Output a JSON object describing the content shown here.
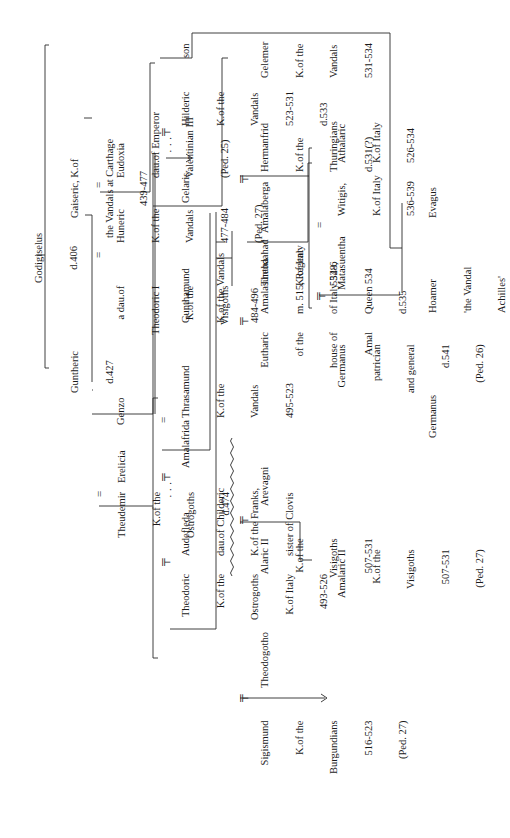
{
  "chart_title": "Genealogy of the Vandal and Ostrogothic royal houses",
  "orientation": "rotated 90 degrees counter-clockwise",
  "nodes": {
    "godigiselus": {
      "lines": [
        "Godigiselus",
        "d.406"
      ]
    },
    "guntheric": {
      "lines": [
        "Guntheric",
        "d.427"
      ]
    },
    "gaiseric": {
      "lines": [
        "Gaiseric, K.of",
        "the Vandals at Carthage",
        "439-477"
      ]
    },
    "genzo": {
      "lines": [
        "Genzo"
      ]
    },
    "dau_theodoric_i": {
      "lines": [
        "a dau.of",
        "Theodoric I",
        "K.of the",
        "Visigoths"
      ]
    },
    "huneric": {
      "lines": [
        "Huneric",
        "K.of the",
        "Vandals",
        "477-484",
        "(Ped. 27)"
      ]
    },
    "eudoxia": {
      "lines": [
        "Eudoxia",
        "dau.of Emperor",
        "Valentinian III",
        "(Ped. 25)"
      ]
    },
    "thrasamund": {
      "lines": [
        "Thrasamund",
        "K.of the",
        "Vandals",
        "495-523"
      ]
    },
    "gunthamund": {
      "lines": [
        "Gunthamund",
        "K.of the Vandals",
        "484-496"
      ]
    },
    "gelaris": {
      "lines": [
        "Gelaris"
      ]
    },
    "hilderic_dots": {
      "lines": [
        "· · ·"
      ]
    },
    "hilderic": {
      "lines": [
        "Hilderic",
        "K.of the",
        "Vandals",
        "523-531",
        "d.533"
      ]
    },
    "son": {
      "lines": [
        "son"
      ]
    },
    "gelemer": {
      "lines": [
        "Gelemer",
        "K.of the",
        "Vandals",
        "531-534"
      ]
    },
    "hoamer": {
      "lines": [
        "Hoamer",
        "'the Vandal",
        "Achilles'"
      ]
    },
    "evagus": {
      "lines": [
        "Evagus"
      ]
    },
    "theudemir": {
      "lines": [
        "Theudemir",
        "K.of the",
        "Ostrogoths",
        "d.474"
      ]
    },
    "erelicia": {
      "lines": [
        "Erelicia"
      ]
    },
    "theodoric": {
      "lines": [
        "Theodoric",
        "K.of the",
        "Ostrogoths",
        "K.of Italy",
        "493-526"
      ]
    },
    "audefleda": {
      "lines": [
        "Audefleda",
        "dau.of Childeric",
        "K.of the Franks,",
        "sister of Clovis"
      ]
    },
    "amalafrida_dots": {
      "lines": [
        "· · ·"
      ]
    },
    "amalafrida": {
      "lines": [
        "Amalafrida"
      ]
    },
    "theodogotho": {
      "lines": [
        "Theodogotho"
      ]
    },
    "arevagni": {
      "lines": [
        "Arevagni"
      ]
    },
    "sigismund": {
      "lines": [
        "Sigismund",
        "K.of the",
        "Burgundians",
        "516-523",
        "(Ped. 27)"
      ]
    },
    "alaric_ii": {
      "lines": [
        "Alaric II",
        "K.of the",
        "Visigoths",
        "507-531"
      ]
    },
    "amalaric_ii": {
      "lines": [
        "Amalaric II",
        "K.of the",
        "Visigoths",
        "507-531",
        "(Ped. 27)"
      ]
    },
    "eutharic": {
      "lines": [
        "Eutharic",
        "of the",
        "house of",
        "Amal"
      ]
    },
    "amalasuntha": {
      "lines": [
        "Amalasuntha",
        "m. 515, Regent",
        "of Italy 528,",
        "Queen 534",
        "d.535"
      ]
    },
    "theodahad": {
      "lines": [
        "Theodahad",
        "K.of Italy",
        "534-6"
      ]
    },
    "amalaberga": {
      "lines": [
        "Amalaberga"
      ]
    },
    "hermanfrid": {
      "lines": [
        "Hermanfrid",
        "K.of the",
        "Thuringians",
        "d.531(?)"
      ]
    },
    "germanus_patrician": {
      "lines": [
        "Germanus",
        "patrician",
        "and general",
        "d.541",
        "(Ped. 26)"
      ]
    },
    "matasuentha": {
      "lines": [
        "Matasuentha"
      ]
    },
    "witigis": {
      "lines": [
        "Witigis,",
        "K.of Italy",
        "536-539"
      ]
    },
    "athalaric": {
      "lines": [
        "Athalaric",
        "K.of Italy",
        "526-534"
      ]
    },
    "germanus_son": {
      "lines": [
        "Germanus"
      ]
    },
    "amalfrid": {
      "lines": [
        "Amalfrid",
        "magister",
        "militum",
        "under",
        "Justinian"
      ]
    },
    "dau_hermanfrid": {
      "lines": [
        "dau."
      ]
    },
    "audoin": {
      "lines": [
        "Audoin",
        "K.of the",
        "Lombards",
        "in Italy",
        "546-c.565",
        "(Ped. 32)"
      ]
    }
  },
  "symbols": {
    "equals": "=",
    "married_tee": "╤",
    "superscript_2": "2"
  }
}
